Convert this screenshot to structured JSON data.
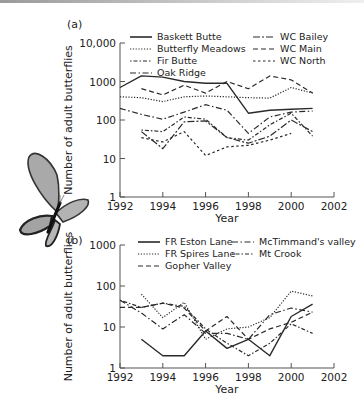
{
  "chart_data": [
    {
      "type": "line",
      "panel_label": "(a)",
      "title": "",
      "xlabel": "Year",
      "ylabel": "Number of adult butterflies",
      "yscale": "log",
      "ylim": [
        1,
        10000
      ],
      "xlim": [
        1992,
        2002
      ],
      "x_ticks": [
        "1992",
        "1994",
        "1996",
        "1998",
        "2000",
        "2002"
      ],
      "y_ticks": [
        "1",
        "10",
        "100",
        "1000",
        "10,000"
      ],
      "grid": false,
      "legend_position": "top",
      "x": [
        1992,
        1993,
        1994,
        1995,
        1996,
        1997,
        1998,
        1999,
        2000,
        2001
      ],
      "series": [
        {
          "name": "Baskett Butte",
          "style": "solid",
          "values": [
            700,
            1400,
            1300,
            1000,
            900,
            900,
            150,
            180,
            190,
            200
          ]
        },
        {
          "name": "Butterfly Meadows",
          "style": "dotted",
          "values": [
            400,
            380,
            300,
            400,
            420,
            400,
            380,
            370,
            700,
            500
          ]
        },
        {
          "name": "Fir Butte",
          "style": "dot-dash",
          "values": [
            null,
            55,
            50,
            120,
            105,
            35,
            30,
            75,
            150,
            38
          ]
        },
        {
          "name": "Oak Ridge",
          "style": "dash-dot",
          "values": [
            200,
            140,
            105,
            160,
            250,
            180,
            45,
            120,
            160,
            170
          ]
        },
        {
          "name": "WC Bailey",
          "style": "long-dash",
          "values": [
            null,
            50,
            18,
            90,
            95,
            35,
            25,
            38,
            100,
            50
          ]
        },
        {
          "name": "WC Main",
          "style": "dashed",
          "values": [
            null,
            650,
            450,
            800,
            500,
            1000,
            650,
            1400,
            1100,
            500
          ]
        },
        {
          "name": "WC North",
          "style": "short-dash",
          "values": [
            null,
            35,
            27,
            50,
            12,
            20,
            22,
            30,
            45,
            null
          ]
        }
      ]
    },
    {
      "type": "line",
      "panel_label": "(b)",
      "title": "",
      "xlabel": "Year",
      "ylabel": "Number of adult butterflies",
      "yscale": "log",
      "ylim": [
        1,
        1000
      ],
      "xlim": [
        1992,
        2002
      ],
      "x_ticks": [
        "1992",
        "1994",
        "1996",
        "1998",
        "2000",
        "2002"
      ],
      "y_ticks": [
        "1",
        "10",
        "100",
        "1000"
      ],
      "grid": false,
      "legend_position": "top",
      "x": [
        1992,
        1993,
        1994,
        1995,
        1996,
        1997,
        1998,
        1999,
        2000,
        2001
      ],
      "series": [
        {
          "name": "FR Eston Lane",
          "style": "solid",
          "values": [
            null,
            5,
            2,
            2,
            8,
            3,
            5,
            2,
            18,
            36
          ]
        },
        {
          "name": "FR Spires Lane",
          "style": "dotted",
          "values": [
            null,
            63,
            17,
            40,
            5,
            9,
            10,
            17,
            75,
            57
          ]
        },
        {
          "name": "Gopher Valley",
          "style": "dashed",
          "values": [
            30,
            30,
            38,
            29,
            8,
            18,
            5,
            9,
            13,
            23
          ]
        },
        {
          "name": "McTimmand's valley",
          "style": "dash-dot",
          "values": [
            45,
            22,
            9,
            20,
            7,
            7,
            5,
            20,
            29,
            23
          ]
        },
        {
          "name": "Mt Crook",
          "style": "dot-dash",
          "values": [
            45,
            30,
            38,
            32,
            9,
            4,
            2,
            4,
            12,
            7
          ]
        }
      ]
    }
  ],
  "illustration": {
    "name": "butterfly",
    "wing_color": "#a8a8a8",
    "body_color": "#1a1a1a"
  },
  "colors": {
    "line": "#2a2a2a",
    "axis": "#555555",
    "background": "#ffffff"
  }
}
